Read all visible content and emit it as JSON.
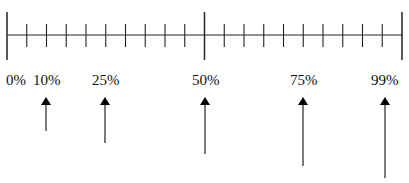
{
  "diagram": {
    "type": "percentile-scale",
    "line_color": "#222222",
    "scale": {
      "x_start": 7,
      "x_end": 402,
      "y": 35,
      "major_ticks_pct": [
        0,
        50,
        99
      ],
      "minor_tick_count_per_half": 9
    },
    "labels": [
      {
        "text": "0%",
        "x": 6
      },
      {
        "text": "10%",
        "x": 33
      },
      {
        "text": "25%",
        "x": 92
      },
      {
        "text": "50%",
        "x": 192
      },
      {
        "text": "75%",
        "x": 290
      },
      {
        "text": "99%",
        "x": 371
      }
    ],
    "arrows": [
      {
        "label": "10%",
        "x": 46,
        "tail_y": 131
      },
      {
        "label": "25%",
        "x": 105,
        "tail_y": 143
      },
      {
        "label": "50%",
        "x": 205,
        "tail_y": 154
      },
      {
        "label": "75%",
        "x": 303,
        "tail_y": 166
      },
      {
        "label": "99%",
        "x": 385,
        "tail_y": 178
      }
    ]
  }
}
